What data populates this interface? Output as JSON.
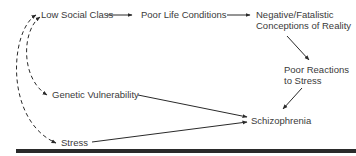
{
  "diagram": {
    "nodes": {
      "low_social_class": {
        "label": "Low Social Class"
      },
      "poor_life_conditions": {
        "label": "Poor Life Conditions"
      },
      "negative_conceptions": {
        "line1": "Negative/Fatalistic",
        "line2": "Conceptions of Reality"
      },
      "poor_reactions": {
        "line1": "Poor Reactions",
        "line2": "to Stress"
      },
      "genetic_vulnerability": {
        "label": "Genetic Vulnerability"
      },
      "stress": {
        "label": "Stress"
      },
      "schizophrenia": {
        "label": "Schizophrenia"
      }
    },
    "edges": [
      {
        "from": "Low Social Class",
        "to": "Poor Life Conditions",
        "style": "solid"
      },
      {
        "from": "Poor Life Conditions",
        "to": "Negative/Fatalistic Conceptions of Reality",
        "style": "solid"
      },
      {
        "from": "Negative/Fatalistic Conceptions of Reality",
        "to": "Poor Reactions to Stress",
        "style": "solid"
      },
      {
        "from": "Poor Reactions to Stress",
        "to": "Schizophrenia",
        "style": "solid"
      },
      {
        "from": "Genetic Vulnerability",
        "to": "Schizophrenia",
        "style": "solid"
      },
      {
        "from": "Stress",
        "to": "Schizophrenia",
        "style": "solid"
      },
      {
        "from": "Genetic Vulnerability",
        "to": "Low Social Class",
        "style": "dashed",
        "bidirectional": true
      },
      {
        "from": "Stress",
        "to": "Low Social Class",
        "style": "dashed",
        "bidirectional": true
      }
    ],
    "colors": {
      "text": "#3a3a3a",
      "line": "#2a2a2a",
      "rule": "#2a2a2a"
    }
  }
}
